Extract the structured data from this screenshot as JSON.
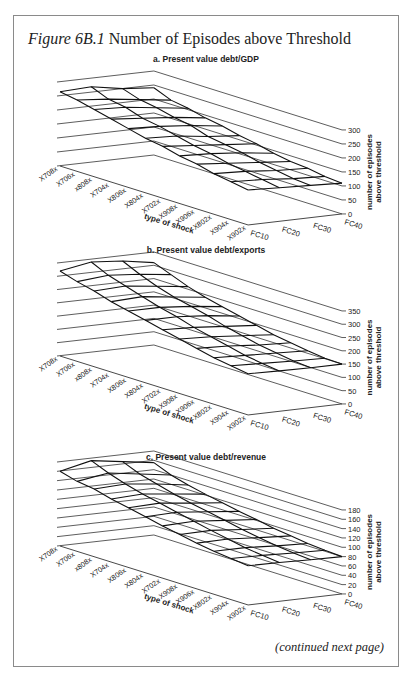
{
  "figure": {
    "label": "Figure 6B.1",
    "title": "Number of Episodes above Threshold",
    "footer": "(continued next page)"
  },
  "chart_data": [
    {
      "type": "surface",
      "title": "a. Present value debt/GDP",
      "xlabel": "type of shock",
      "ylabel": "",
      "zlabel": "number of episodes above threshold",
      "x_categories": [
        "X708x",
        "X706x",
        "x808x",
        "X704x",
        "X806x",
        "X804x",
        "X702x",
        "X908x",
        "X906x",
        "X802x",
        "X904x",
        "X902x"
      ],
      "y_categories": [
        "FC10",
        "FC20",
        "FC30",
        "FC40"
      ],
      "z_ticks": [
        0,
        50,
        100,
        150,
        200,
        250,
        300
      ],
      "zlim": [
        0,
        300
      ],
      "values": [
        [
          265,
          270,
          250,
          240
        ],
        [
          255,
          245,
          230,
          215
        ],
        [
          240,
          235,
          220,
          205
        ],
        [
          225,
          215,
          205,
          190
        ],
        [
          210,
          205,
          195,
          180
        ],
        [
          195,
          190,
          175,
          165
        ],
        [
          185,
          175,
          165,
          155
        ],
        [
          170,
          165,
          155,
          140
        ],
        [
          160,
          150,
          140,
          130
        ],
        [
          145,
          140,
          130,
          125
        ],
        [
          135,
          130,
          120,
          115
        ],
        [
          125,
          120,
          115,
          110
        ]
      ]
    },
    {
      "type": "surface",
      "title": "b. Present value debt/exports",
      "xlabel": "type of shock",
      "ylabel": "",
      "zlabel": "number of episodes above threshold",
      "x_categories": [
        "X708x",
        "X706x",
        "x808x",
        "X704x",
        "X806x",
        "X804x",
        "X702x",
        "X908x",
        "X906x",
        "X802x",
        "X904x",
        "X902x"
      ],
      "y_categories": [
        "FC10",
        "FC20",
        "FC30",
        "FC40"
      ],
      "z_ticks": [
        0,
        50,
        100,
        150,
        200,
        250,
        300,
        350
      ],
      "zlim": [
        0,
        350
      ],
      "values": [
        [
          320,
          340,
          330,
          310
        ],
        [
          300,
          310,
          300,
          285
        ],
        [
          285,
          290,
          275,
          260
        ],
        [
          265,
          270,
          255,
          240
        ],
        [
          250,
          250,
          240,
          225
        ],
        [
          235,
          235,
          225,
          210
        ],
        [
          220,
          215,
          205,
          195
        ],
        [
          205,
          200,
          190,
          180
        ],
        [
          190,
          185,
          175,
          170
        ],
        [
          175,
          170,
          165,
          160
        ],
        [
          165,
          160,
          155,
          152
        ],
        [
          155,
          152,
          150,
          150
        ]
      ]
    },
    {
      "type": "surface",
      "title": "c. Present value debt/revenue",
      "xlabel": "type of shock",
      "ylabel": "",
      "zlabel": "number of episodes above threshold",
      "x_categories": [
        "X708x",
        "X706x",
        "x808x",
        "X704x",
        "X806x",
        "X804x",
        "X702x",
        "X908x",
        "X906x",
        "X802x",
        "X904x",
        "X902x"
      ],
      "y_categories": [
        "FC10",
        "FC20",
        "FC30",
        "FC40"
      ],
      "z_ticks": [
        0,
        20,
        40,
        60,
        80,
        100,
        120,
        140,
        160,
        180
      ],
      "zlim": [
        0,
        180
      ],
      "values": [
        [
          160,
          175,
          165,
          155
        ],
        [
          150,
          160,
          150,
          140
        ],
        [
          145,
          148,
          140,
          130
        ],
        [
          135,
          138,
          130,
          122
        ],
        [
          128,
          130,
          122,
          115
        ],
        [
          120,
          122,
          115,
          108
        ],
        [
          112,
          114,
          108,
          102
        ],
        [
          105,
          106,
          100,
          95
        ],
        [
          98,
          99,
          94,
          90
        ],
        [
          92,
          92,
          88,
          85
        ],
        [
          88,
          87,
          84,
          82
        ],
        [
          84,
          83,
          81,
          80
        ]
      ]
    }
  ]
}
